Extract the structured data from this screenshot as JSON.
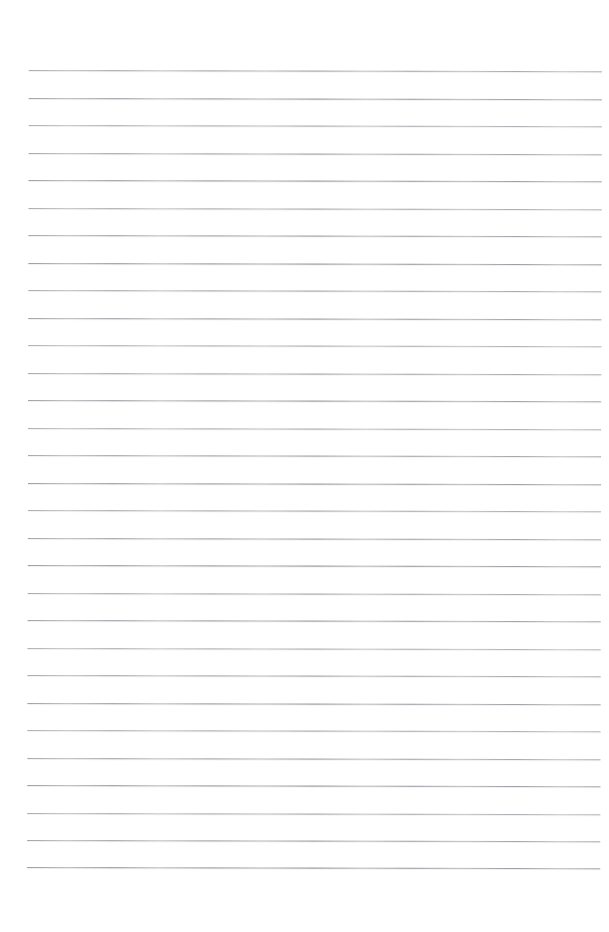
{
  "page": {
    "kind": "scanned-blank-ruled-notebook-page",
    "width": 609,
    "height": 932,
    "background_color": "#ffffff",
    "text_content": "",
    "has_handwriting": false,
    "has_printed_text": false
  },
  "ruling": {
    "line_color": "#c2c2c4",
    "line_thickness_px": 1,
    "line_count": 30,
    "first_line_y": 70,
    "line_spacing_px": 27.5,
    "line_start_x": 29,
    "line_end_x": 602,
    "skew_degrees": 0.12,
    "style": "faded-horizontal-rules"
  },
  "margins": {
    "top_blank_px": 70,
    "bottom_blank_px": 65,
    "left_blank_px": 29,
    "right_blank_px": 7
  },
  "lines": [
    {
      "index": 1,
      "y": 70.0
    },
    {
      "index": 2,
      "y": 97.5
    },
    {
      "index": 3,
      "y": 125.0
    },
    {
      "index": 4,
      "y": 152.5
    },
    {
      "index": 5,
      "y": 180.0
    },
    {
      "index": 6,
      "y": 207.5
    },
    {
      "index": 7,
      "y": 235.0
    },
    {
      "index": 8,
      "y": 262.5
    },
    {
      "index": 9,
      "y": 290.0
    },
    {
      "index": 10,
      "y": 317.5
    },
    {
      "index": 11,
      "y": 345.0
    },
    {
      "index": 12,
      "y": 372.5
    },
    {
      "index": 13,
      "y": 400.0
    },
    {
      "index": 14,
      "y": 427.5
    },
    {
      "index": 15,
      "y": 455.0
    },
    {
      "index": 16,
      "y": 482.5
    },
    {
      "index": 17,
      "y": 510.0
    },
    {
      "index": 18,
      "y": 537.5
    },
    {
      "index": 19,
      "y": 565.0
    },
    {
      "index": 20,
      "y": 592.5
    },
    {
      "index": 21,
      "y": 620.0
    },
    {
      "index": 22,
      "y": 647.5
    },
    {
      "index": 23,
      "y": 675.0
    },
    {
      "index": 24,
      "y": 702.5
    },
    {
      "index": 25,
      "y": 730.0
    },
    {
      "index": 26,
      "y": 757.5
    },
    {
      "index": 27,
      "y": 785.0
    },
    {
      "index": 28,
      "y": 812.5
    },
    {
      "index": 29,
      "y": 840.0
    },
    {
      "index": 30,
      "y": 867.0
    }
  ]
}
